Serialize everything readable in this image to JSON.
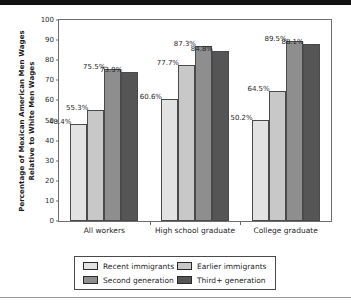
{
  "chart_data": {
    "type": "bar",
    "title": "",
    "subtitle": "",
    "xlabel": "",
    "ylabel": "Percentage of Mexican American Men Wages Relative to White Men Wages",
    "ylabel_line1": "Percentage of Mexican American Men Wages",
    "ylabel_line2": "Relative to White Men Wages",
    "ylim": [
      0,
      100
    ],
    "ytick_labels": [
      "0",
      "10",
      "20",
      "30",
      "40",
      "50",
      "60",
      "70",
      "80",
      "90",
      "100"
    ],
    "ytick_values": [
      0,
      10,
      20,
      30,
      40,
      50,
      60,
      70,
      80,
      90,
      100
    ],
    "grid": false,
    "legend_position": "bottom",
    "categories": [
      "All workers",
      "High school graduate",
      "College graduate"
    ],
    "series": [
      {
        "name": "Recent immigrants",
        "color": "#e2e2e2",
        "values": [
          48.4,
          60.6,
          50.2
        ],
        "labels": [
          "48.4%",
          "60.6%",
          "50.2%"
        ]
      },
      {
        "name": "Earlier immigrants",
        "color": "#c8c8c8",
        "values": [
          55.3,
          77.7,
          64.5
        ],
        "labels": [
          "55.3%",
          "77.7%",
          "64.5%"
        ]
      },
      {
        "name": "Second generation",
        "color": "#8e8e8e",
        "values": [
          75.5,
          87.3,
          89.5
        ],
        "labels": [
          "75.5%",
          "87.3%",
          "89.5%"
        ]
      },
      {
        "name": "Third+ generation",
        "color": "#555555",
        "values": [
          73.9,
          84.8,
          88.1
        ],
        "labels": [
          "73.9%",
          "84.8%",
          "88.1%"
        ]
      }
    ]
  },
  "legend": {
    "items": [
      {
        "label": "Recent immigrants"
      },
      {
        "label": "Earlier immigrants"
      },
      {
        "label": "Second generation"
      },
      {
        "label": "Third+ generation"
      }
    ]
  }
}
